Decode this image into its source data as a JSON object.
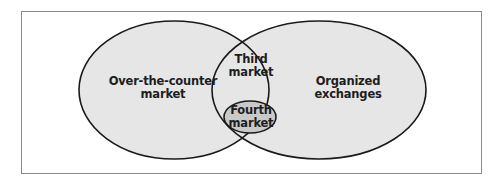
{
  "diagram": {
    "type": "venn",
    "colors": {
      "fill_outer": "#e6e6e6",
      "fill_inner": "#c9c9c9",
      "stroke": "#1a1a1a",
      "frame": "#8a8a8a",
      "text": "#1e1e1e"
    },
    "sets": [
      {
        "id": "otc",
        "label_lines": [
          "Over-the-counter",
          "market"
        ]
      },
      {
        "id": "organized",
        "label_lines": [
          "Organized",
          "exchanges"
        ]
      },
      {
        "id": "third",
        "label_lines": [
          "Third",
          "market"
        ],
        "note": "intersection of over-the-counter market and organized exchanges"
      },
      {
        "id": "fourth",
        "label_lines": [
          "Fourth",
          "market"
        ],
        "note": "subset within third market"
      }
    ]
  }
}
